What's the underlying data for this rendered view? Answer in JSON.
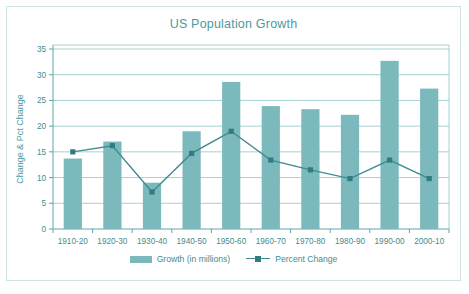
{
  "chart_data": {
    "type": "bar",
    "title": "US Population Growth",
    "xlabel": "",
    "ylabel": "Change & Pct Change",
    "ylim": [
      0,
      35
    ],
    "yticks": [
      0,
      5,
      10,
      15,
      20,
      25,
      30,
      35
    ],
    "grid": true,
    "legend_position": "bottom",
    "categories": [
      "1910-20",
      "1920-30",
      "1930-40",
      "1940-50",
      "1950-60",
      "1960-70",
      "1970-80",
      "1980-90",
      "1990-00",
      "2000-10"
    ],
    "series": [
      {
        "name": "Growth (in millions)",
        "type": "bar",
        "color": "#7cb9bd",
        "values": [
          13.7,
          17.0,
          9.0,
          19.0,
          28.6,
          23.9,
          23.3,
          22.2,
          32.7,
          27.3
        ]
      },
      {
        "name": "Percent Change",
        "type": "line",
        "color": "#3f8c91",
        "values": [
          15.0,
          16.2,
          7.2,
          14.7,
          19.0,
          13.4,
          11.5,
          9.8,
          13.4,
          9.8
        ]
      }
    ]
  },
  "legend": {
    "entries": [
      {
        "label": "Growth (in millions)"
      },
      {
        "label": "Percent Change"
      }
    ]
  }
}
